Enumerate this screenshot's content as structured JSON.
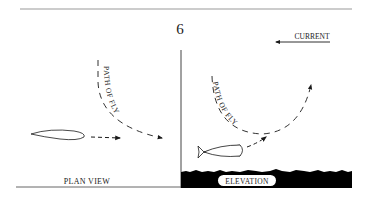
{
  "page_number": "6",
  "plan_view": {
    "caption": "PLAN VIEW",
    "path_label": "PATH OF FLY"
  },
  "elevation": {
    "caption": "ELEVATION",
    "path_label": "PATH OF FLY",
    "current_label": "CURRENT"
  },
  "colors": {
    "ink": "#1a1a1a",
    "rule": "#888888",
    "ground": "#000000"
  }
}
